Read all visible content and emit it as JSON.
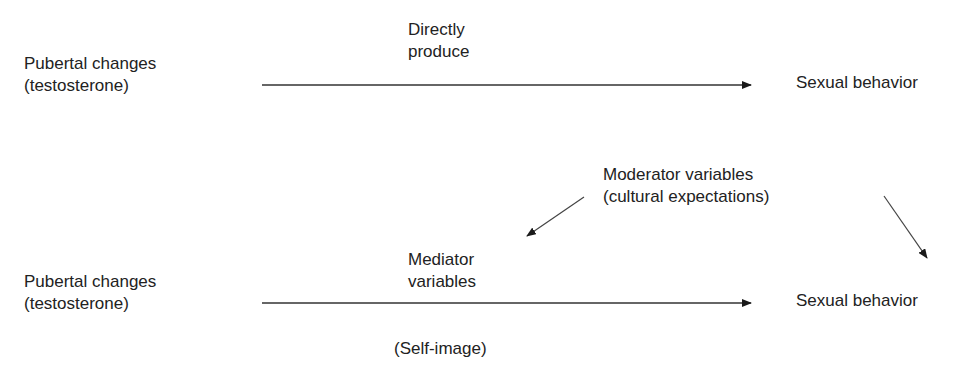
{
  "diagram": {
    "top_model": {
      "source": {
        "line1": "Pubertal changes",
        "line2": "(testosterone)"
      },
      "edge_label": {
        "line1": "Directly",
        "line2": "produce"
      },
      "target": "Sexual behavior"
    },
    "bottom_model": {
      "source": {
        "line1": "Pubertal changes",
        "line2": "(testosterone)"
      },
      "mediator": {
        "line1": "Mediator",
        "line2": "variables",
        "example": "(Self-image)"
      },
      "moderator": {
        "line1": "Moderator variables",
        "line2": "(cultural expectations)"
      },
      "target": "Sexual behavior"
    },
    "colors": {
      "text": "#222222",
      "line": "#333333",
      "background": "#ffffff"
    }
  }
}
